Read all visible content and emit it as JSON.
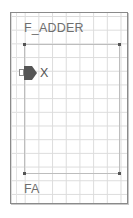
{
  "symbol": {
    "title": "F_ADDER",
    "instance_label": "FA",
    "ports": [
      {
        "name": "X",
        "direction": "input",
        "side": "left",
        "icon": "input-port-arrow-icon"
      }
    ],
    "colors": {
      "frame_border": "#8a8a8a",
      "grid_line": "#dcdcdc",
      "body_outline": "#bdbdbd",
      "corner_dot": "#555555",
      "port_fill": "#555555",
      "label_text": "#6e6e6e"
    }
  }
}
